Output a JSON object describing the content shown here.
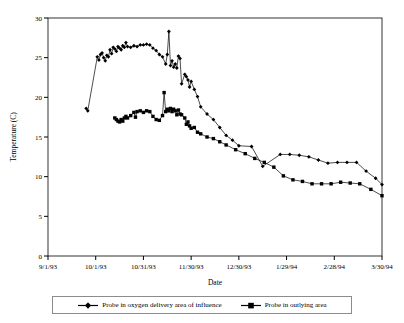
{
  "chart_data": {
    "type": "line",
    "title": "",
    "xlabel": "Date",
    "ylabel": "Temperature (C)",
    "ylim": [
      0,
      30
    ],
    "yticks": [
      0,
      5,
      10,
      15,
      20,
      25,
      30
    ],
    "xticklabels": [
      "9/1/93",
      "10/1/93",
      "10/31/93",
      "11/30/93",
      "12/30/93",
      "1/29/94",
      "2/28/94",
      "3/30/94"
    ],
    "xtick_days": [
      0,
      30,
      60,
      90,
      120,
      150,
      180,
      210
    ],
    "xlim_days": [
      0,
      210
    ],
    "grid": false,
    "legend_position": "bottom",
    "series": [
      {
        "name": "Probe in oxygen delivery area of influence",
        "marker": "diamond",
        "color": "#000000",
        "points": [
          [
            24,
            18.6
          ],
          [
            25,
            18.3
          ],
          [
            31,
            25.1
          ],
          [
            32,
            24.7
          ],
          [
            33,
            25.4
          ],
          [
            34,
            25.6
          ],
          [
            35,
            25.0
          ],
          [
            36,
            24.6
          ],
          [
            37,
            25.3
          ],
          [
            38,
            25.1
          ],
          [
            39,
            26.0
          ],
          [
            40,
            25.5
          ],
          [
            41,
            26.3
          ],
          [
            42,
            26.1
          ],
          [
            43,
            25.8
          ],
          [
            44,
            26.4
          ],
          [
            45,
            26.2
          ],
          [
            46,
            26.0
          ],
          [
            47,
            26.5
          ],
          [
            48,
            26.3
          ],
          [
            49,
            26.9
          ],
          [
            50,
            26.4
          ],
          [
            52,
            26.3
          ],
          [
            54,
            26.5
          ],
          [
            56,
            26.4
          ],
          [
            58,
            26.6
          ],
          [
            60,
            26.6
          ],
          [
            62,
            26.7
          ],
          [
            64,
            26.6
          ],
          [
            66,
            26.2
          ],
          [
            68,
            25.9
          ],
          [
            70,
            25.4
          ],
          [
            72,
            25.1
          ],
          [
            74,
            24.2
          ],
          [
            75,
            25.4
          ],
          [
            76,
            28.3
          ],
          [
            77,
            24.0
          ],
          [
            78,
            24.6
          ],
          [
            79,
            23.8
          ],
          [
            80,
            24.2
          ],
          [
            81,
            23.7
          ],
          [
            82,
            25.2
          ],
          [
            83,
            24.9
          ],
          [
            84,
            21.7
          ],
          [
            86,
            22.9
          ],
          [
            87,
            22.6
          ],
          [
            88,
            22.2
          ],
          [
            89,
            21.3
          ],
          [
            90,
            22.0
          ],
          [
            92,
            21.0
          ],
          [
            94,
            20.1
          ],
          [
            96,
            18.8
          ],
          [
            100,
            17.9
          ],
          [
            104,
            17.2
          ],
          [
            108,
            16.2
          ],
          [
            112,
            15.2
          ],
          [
            116,
            14.6
          ],
          [
            120,
            13.9
          ],
          [
            128,
            13.8
          ],
          [
            135,
            11.3
          ],
          [
            146,
            12.8
          ],
          [
            152,
            12.8
          ],
          [
            158,
            12.7
          ],
          [
            164,
            12.5
          ],
          [
            170,
            12.1
          ],
          [
            176,
            11.7
          ],
          [
            182,
            11.8
          ],
          [
            188,
            11.8
          ],
          [
            194,
            11.8
          ],
          [
            200,
            10.7
          ],
          [
            206,
            9.8
          ],
          [
            210,
            9.0
          ]
        ]
      },
      {
        "name": "Probe in outlying area",
        "marker": "square",
        "color": "#000000",
        "points": [
          [
            42,
            17.4
          ],
          [
            43,
            17.2
          ],
          [
            44,
            17.0
          ],
          [
            45,
            16.9
          ],
          [
            46,
            17.2
          ],
          [
            47,
            17.0
          ],
          [
            48,
            17.4
          ],
          [
            49,
            17.6
          ],
          [
            50,
            17.4
          ],
          [
            52,
            17.7
          ],
          [
            54,
            18.1
          ],
          [
            55,
            17.5
          ],
          [
            56,
            18.2
          ],
          [
            58,
            18.3
          ],
          [
            60,
            18.1
          ],
          [
            62,
            18.3
          ],
          [
            64,
            18.2
          ],
          [
            66,
            17.6
          ],
          [
            68,
            17.2
          ],
          [
            70,
            17.1
          ],
          [
            72,
            17.7
          ],
          [
            73,
            20.6
          ],
          [
            74,
            18.2
          ],
          [
            75,
            18.5
          ],
          [
            76,
            18.3
          ],
          [
            77,
            18.6
          ],
          [
            78,
            18.2
          ],
          [
            79,
            18.5
          ],
          [
            80,
            18.3
          ],
          [
            81,
            17.8
          ],
          [
            82,
            18.4
          ],
          [
            83,
            17.9
          ],
          [
            84,
            17.8
          ],
          [
            86,
            17.4
          ],
          [
            87,
            16.6
          ],
          [
            88,
            16.9
          ],
          [
            89,
            16.4
          ],
          [
            90,
            16.1
          ],
          [
            92,
            16.2
          ],
          [
            94,
            15.6
          ],
          [
            96,
            15.4
          ],
          [
            100,
            15.0
          ],
          [
            104,
            14.8
          ],
          [
            108,
            14.4
          ],
          [
            112,
            14.0
          ],
          [
            118,
            13.4
          ],
          [
            124,
            12.9
          ],
          [
            130,
            12.3
          ],
          [
            136,
            11.8
          ],
          [
            142,
            11.2
          ],
          [
            148,
            10.1
          ],
          [
            154,
            9.6
          ],
          [
            160,
            9.4
          ],
          [
            166,
            9.1
          ],
          [
            172,
            9.1
          ],
          [
            178,
            9.1
          ],
          [
            184,
            9.3
          ],
          [
            190,
            9.2
          ],
          [
            196,
            9.1
          ],
          [
            203,
            8.4
          ],
          [
            210,
            7.6
          ]
        ]
      }
    ]
  },
  "legend": {
    "items": [
      {
        "label": "Probe in oxygen delivery area of influence",
        "marker": "diamond"
      },
      {
        "label": "Probe in outlying area",
        "marker": "square"
      }
    ]
  }
}
